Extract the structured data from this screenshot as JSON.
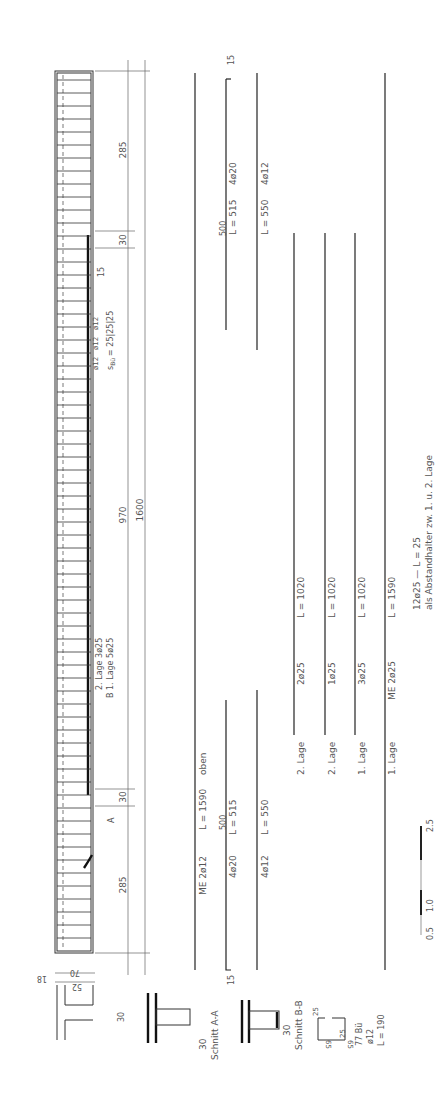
{
  "drawing": {
    "type": "reinforcement-detail",
    "orientation": "rotated -90deg",
    "beam_elevation": {
      "dimensions": {
        "end_left": "285",
        "support_gap_left": "30",
        "mid_span": "970",
        "support_gap_right": "30",
        "end_right": "285",
        "total": "1600",
        "stirrup_extra": "15"
      },
      "section_marks": {
        "a": "A",
        "b": "B"
      },
      "stirrup_spacing_label": "s",
      "stirrup_spacing_sub": "Bü",
      "stirrup_spacing_value": "= 25|25|25",
      "stirrup_bar_labels": [
        "ø12",
        "ø12",
        "ø12"
      ],
      "layer_labels": {
        "second": "2. Lage 3ø25",
        "first": "1. Lage 5ø25"
      }
    },
    "bar_schedule": [
      {
        "id": "me-top",
        "label": "ME 2ø12",
        "length": "L = 1590",
        "note": "oben"
      },
      {
        "id": "bar-4o20",
        "label": "4ø20",
        "length": "L = 515",
        "above": "500",
        "hook": "15"
      },
      {
        "id": "bar-4o12",
        "label": "4ø12",
        "length": "L = 550"
      },
      {
        "id": "row-2lage-a",
        "layer": "2. Lage",
        "label": "2ø25",
        "length": "L = 1020"
      },
      {
        "id": "row-2lage-b",
        "layer": "2. Lage",
        "label": "1ø25",
        "length": "L = 1020"
      },
      {
        "id": "row-1lage-a",
        "layer": "1. Lage",
        "label": "3ø25",
        "length": "L = 1020"
      },
      {
        "id": "row-1lage-b",
        "layer": "1. Lage",
        "label": "ME 2ø25",
        "length": "L = 1590"
      }
    ],
    "right_bars": [
      {
        "label": "4ø20",
        "length": "L = 515",
        "above": "500",
        "hook": "15"
      },
      {
        "label": "4ø12",
        "length": "L = 550"
      }
    ],
    "spacer_note": {
      "line1": "12ø25 — L = 25",
      "line2": "als Abstandhalter zw. 1. u. 2. Lage"
    },
    "sections": {
      "cross_section": {
        "dims": {
          "a": "18",
          "b": "70",
          "c": "52",
          "flange": "30"
        }
      },
      "section_aa": {
        "title": "Schnitt A-A",
        "dim": "30"
      },
      "section_bb": {
        "title": "Schnitt B-B",
        "dim": "30"
      }
    },
    "stirrup_shape": {
      "dims": [
        "25",
        "65",
        "65",
        "25"
      ],
      "count": "77 Bü",
      "diameter": "ø12",
      "length": "L = 190"
    },
    "scale_bar": {
      "ticks": [
        "0.5",
        "1.0",
        "2.5"
      ]
    }
  }
}
